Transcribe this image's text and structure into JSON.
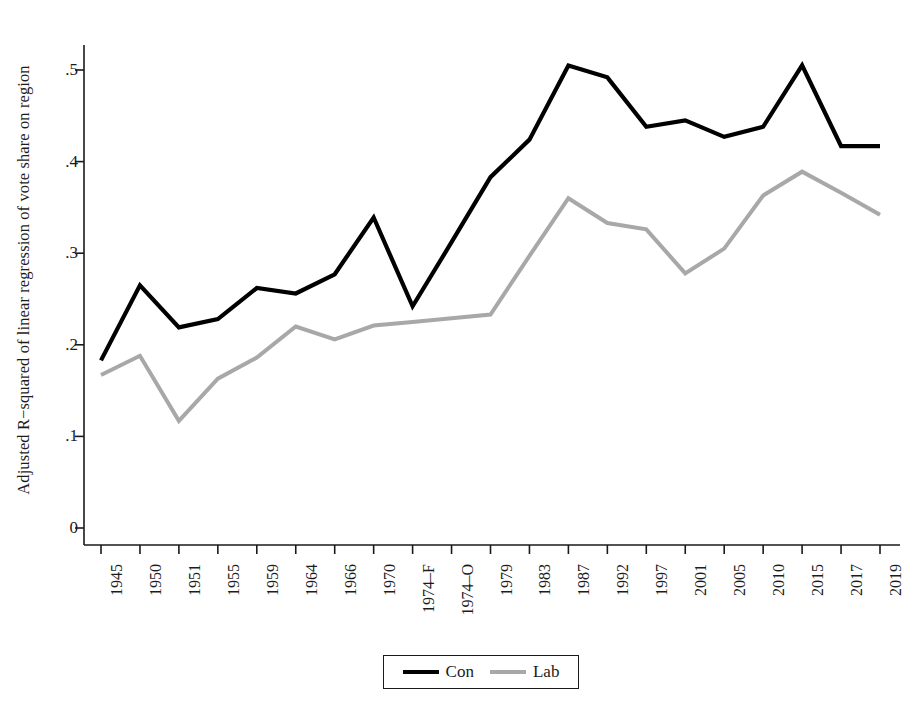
{
  "chart_data": {
    "type": "line",
    "title": "",
    "xlabel": "",
    "ylabel": "Adjusted R−squared of linear regression of vote share on region",
    "categories": [
      "1945",
      "1950",
      "1951",
      "1955",
      "1959",
      "1964",
      "1966",
      "1970",
      "1974–F",
      "1974–O",
      "1979",
      "1983",
      "1987",
      "1992",
      "1997",
      "2001",
      "2005",
      "2010",
      "2015",
      "2017",
      "2019"
    ],
    "ylim": [
      0,
      0.53
    ],
    "yticks": [
      0,
      0.1,
      0.2,
      0.3,
      0.4,
      0.5
    ],
    "ytick_labels": [
      "0",
      ".1",
      ".2",
      ".3",
      ".4",
      ".5"
    ],
    "grid": false,
    "legend_position": "bottom-center",
    "series": [
      {
        "name": "Con",
        "color": "#000000",
        "values": [
          0.183,
          0.265,
          0.219,
          0.228,
          0.262,
          0.256,
          0.277,
          0.339,
          0.242,
          0.312,
          0.383,
          0.424,
          0.505,
          0.492,
          0.438,
          0.445,
          0.427,
          0.438,
          0.505,
          0.417,
          0.417
        ]
      },
      {
        "name": "Lab",
        "color": "#a8a8a8",
        "values": [
          0.167,
          0.188,
          0.117,
          0.163,
          0.186,
          0.22,
          0.206,
          0.221,
          0.225,
          0.229,
          0.233,
          0.297,
          0.36,
          0.333,
          0.326,
          0.278,
          0.305,
          0.363,
          0.389,
          0.366,
          0.342
        ]
      }
    ]
  },
  "axes": {
    "ytick_labels": [
      "0",
      ".1",
      ".2",
      ".3",
      ".4",
      ".5"
    ],
    "xtick_labels": [
      "1945",
      "1950",
      "1951",
      "1955",
      "1959",
      "1964",
      "1966",
      "1970",
      "1974–F",
      "1974–O",
      "1979",
      "1983",
      "1987",
      "1992",
      "1997",
      "2001",
      "2005",
      "2010",
      "2015",
      "2017",
      "2019"
    ]
  },
  "legend": {
    "items": [
      {
        "label": "Con",
        "color": "#000000"
      },
      {
        "label": "Lab",
        "color": "#a8a8a8"
      }
    ]
  },
  "colors": {
    "axis": "#1a1a1a",
    "con": "#000000",
    "lab": "#a8a8a8",
    "background": "#ffffff"
  }
}
